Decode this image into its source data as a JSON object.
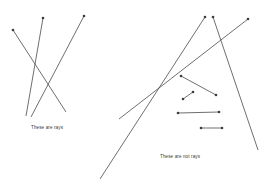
{
  "figure": {
    "width": 270,
    "height": 193,
    "background_color": "#ffffff",
    "stroke_color": "#4a4a4a",
    "dot_color": "#3c3c3c",
    "stroke_width": 0.8,
    "dot_radius": 1.3
  },
  "labels": {
    "rays": "These are rays",
    "not_rays": "These are not rays"
  },
  "rays": [
    {
      "name": "ray-1",
      "endpoint": {
        "x": 13,
        "y": 30
      },
      "through": {
        "x": 66,
        "y": 112
      },
      "endpoint_label": "",
      "description": "ray pointing down-right from upper left"
    },
    {
      "name": "ray-2",
      "endpoint": {
        "x": 43,
        "y": 18
      },
      "through": {
        "x": 26,
        "y": 116
      },
      "endpoint_label": "",
      "description": "steep ray pointing down-left"
    },
    {
      "name": "ray-3",
      "endpoint": {
        "x": 84,
        "y": 16
      },
      "through": {
        "x": 31,
        "y": 117
      },
      "endpoint_label": "",
      "description": "long ray from top center to lower left"
    },
    {
      "name": "ray-4",
      "endpoint": {
        "x": 205,
        "y": 17
      },
      "through": {
        "x": 100,
        "y": 179
      },
      "endpoint_label": "",
      "description": "long ray from upper right to lower left"
    },
    {
      "name": "ray-5",
      "endpoint": {
        "x": 213,
        "y": 17
      },
      "through": {
        "x": 258,
        "y": 150
      },
      "endpoint_label": "",
      "description": "ray from top right heading down-right"
    },
    {
      "name": "ray-6",
      "endpoint": {
        "x": 248,
        "y": 19
      },
      "through": {
        "x": 119,
        "y": 119
      },
      "endpoint_label": "",
      "description": "ray from far upper right to lower left"
    }
  ],
  "segments": [
    {
      "name": "segment-1",
      "start": {
        "x": 181,
        "y": 76
      },
      "end": {
        "x": 216,
        "y": 95
      },
      "description": "short segment with dots on both ends"
    },
    {
      "name": "segment-2",
      "start": {
        "x": 183,
        "y": 99
      },
      "end": {
        "x": 193,
        "y": 92
      },
      "description": "very short segment with dots on both ends"
    },
    {
      "name": "segment-3",
      "start": {
        "x": 178,
        "y": 113
      },
      "end": {
        "x": 219,
        "y": 112
      },
      "description": "horizontal segment with dots on both ends"
    },
    {
      "name": "segment-4",
      "start": {
        "x": 201,
        "y": 128
      },
      "end": {
        "x": 222,
        "y": 128
      },
      "description": "horizontal segment with dots on both ends"
    }
  ]
}
